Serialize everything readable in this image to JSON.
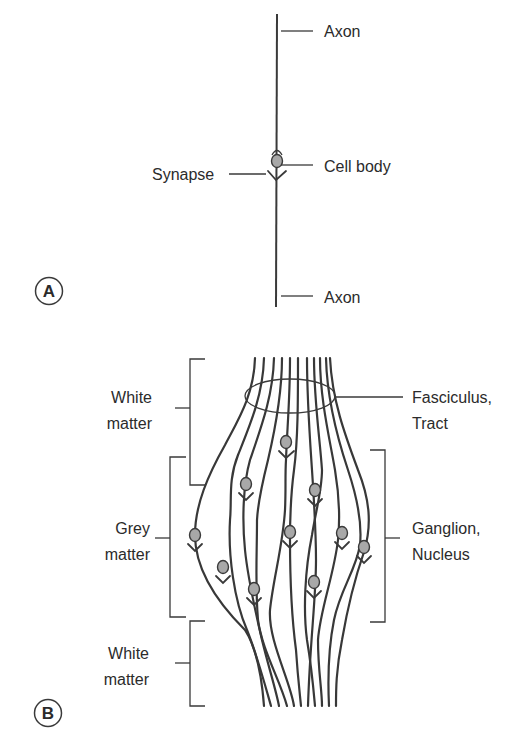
{
  "panel_a": {
    "badge": "A",
    "labels": {
      "axon_top": "Axon",
      "cell_body": "Cell body",
      "synapse": "Synapse",
      "axon_bottom": "Axon"
    }
  },
  "panel_b": {
    "badge": "B",
    "left_labels": {
      "white_matter_top": [
        "White",
        "matter"
      ],
      "grey_matter": [
        "Grey",
        "matter"
      ],
      "white_matter_bottom": [
        "White",
        "matter"
      ]
    },
    "right_labels": {
      "fasciculus": [
        "Fasciculus,",
        "Tract"
      ],
      "ganglion": [
        "Ganglion,",
        "Nucleus"
      ]
    }
  },
  "colors": {
    "line": "#3a3a3a",
    "cell_body_fill": "#a8a8a8",
    "text": "#2b2b2b",
    "background": "#ffffff"
  }
}
